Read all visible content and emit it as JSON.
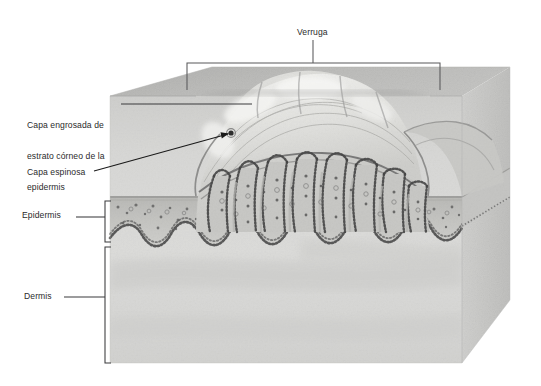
{
  "figure": {
    "type": "histology-illustration",
    "language": "es",
    "background_color": "#ffffff",
    "leader_line_color": "#58585a",
    "pointer_line_color": "#1a1a1a",
    "tissue": {
      "block_fill": "#c9c9c7",
      "top_surface_fill": "#b9b9b7",
      "dermis_fill": "#d5d5d3",
      "epidermis_fill": "#c2c2bf",
      "wart_fill": "#d9d9d6",
      "stratum_corneum_fill": "#e6e6e3",
      "basal_cell_color": "#4a4a4a"
    }
  },
  "labels": {
    "verruga": {
      "text": "Verruga",
      "bracket": {
        "left": 187,
        "right": 440,
        "top": 63,
        "stem_x": 313,
        "stem_top": 40
      }
    },
    "capa_engrosada": {
      "line1": "Capa engrosada de",
      "line2": "estrato córneo de la",
      "line3": "epidermis",
      "leader": {
        "x1": 121,
        "y1": 104,
        "x2": 252,
        "y2": 104
      }
    },
    "capa_espinosa": {
      "text": "Capa espinosa",
      "leader": {
        "x1": 94,
        "y1": 171,
        "x2": 232,
        "y2": 133
      }
    },
    "epidermis": {
      "text": "Epidermis",
      "leader": {
        "x1": 76,
        "y1": 217,
        "x2": 105,
        "y2": 217
      },
      "bracket": {
        "x": 105,
        "top": 201,
        "bottom": 242,
        "tick": 6
      }
    },
    "dermis": {
      "text": "Dermis",
      "leader": {
        "x1": 64,
        "y1": 297,
        "x2": 105,
        "y2": 297
      },
      "bracket": {
        "x": 105,
        "top": 247,
        "bottom": 363,
        "tick": 6
      }
    }
  }
}
